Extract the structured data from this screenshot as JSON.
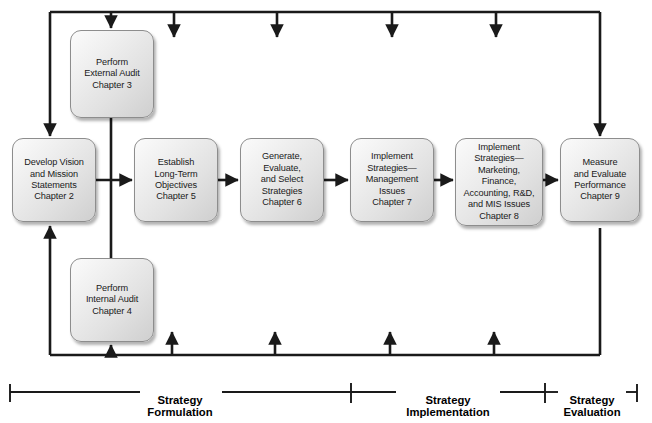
{
  "diagram": {
    "type": "flowchart",
    "nodes": [
      {
        "id": "external-audit",
        "label": "Perform\nExternal Audit\nChapter 3",
        "chapter": "Chapter 3",
        "x": 70,
        "y": 30,
        "w": 84,
        "h": 88
      },
      {
        "id": "develop-vision",
        "label": "Develop Vision\nand Mission\nStatements\nChapter 2",
        "chapter": "Chapter 2",
        "x": 12,
        "y": 138,
        "w": 84,
        "h": 84
      },
      {
        "id": "long-term-objectives",
        "label": "Establish\nLong-Term\nObjectives\nChapter 5",
        "chapter": "Chapter 5",
        "x": 134,
        "y": 138,
        "w": 84,
        "h": 84
      },
      {
        "id": "generate-strategies",
        "label": "Generate,\nEvaluate,\nand Select\nStrategies\nChapter 6",
        "chapter": "Chapter 6",
        "x": 240,
        "y": 138,
        "w": 84,
        "h": 84
      },
      {
        "id": "implement-management",
        "label": "Implement\nStrategies—\nManagement\nIssues\nChapter 7",
        "chapter": "Chapter 7",
        "x": 350,
        "y": 138,
        "w": 84,
        "h": 84
      },
      {
        "id": "implement-functional",
        "label": "Implement\nStrategies—\nMarketing,\nFinance,\nAccounting, R&D,\nand MIS Issues\nChapter 8",
        "chapter": "Chapter 8",
        "x": 455,
        "y": 138,
        "w": 88,
        "h": 88
      },
      {
        "id": "measure-evaluate",
        "label": "Measure\nand Evaluate\nPerformance\nChapter 9",
        "chapter": "Chapter 9",
        "x": 560,
        "y": 138,
        "w": 80,
        "h": 84
      },
      {
        "id": "internal-audit",
        "label": "Perform\nInternal Audit\nChapter 4",
        "chapter": "Chapter 4",
        "x": 70,
        "y": 258,
        "w": 84,
        "h": 84
      }
    ],
    "phases": [
      {
        "id": "strategy-formulation",
        "label": "Strategy\nFormulation",
        "cx": 180,
        "y": 381
      },
      {
        "id": "strategy-implementation",
        "label": "Strategy\nImplementation",
        "cx": 448,
        "y": 381
      },
      {
        "id": "strategy-evaluation",
        "label": "Strategy\nEvaluation",
        "cx": 592,
        "y": 381
      }
    ],
    "colors": {
      "line": "#1a1a1a",
      "node_border": "#8d8d8d",
      "node_fill_light": "#fbfbfb",
      "node_fill_dark": "#cfcfcf",
      "text": "#1a1a1a",
      "background": "#ffffff"
    }
  }
}
